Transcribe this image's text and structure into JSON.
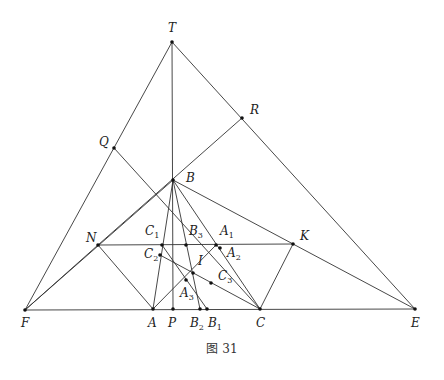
{
  "caption": "图 31",
  "points": [
    {
      "id": "T",
      "label": "T",
      "sub": "",
      "x": 172,
      "y": 42,
      "lx": 168,
      "ly": 32
    },
    {
      "id": "R",
      "label": "R",
      "sub": "",
      "x": 242,
      "y": 118,
      "lx": 250,
      "ly": 114
    },
    {
      "id": "Q",
      "label": "Q",
      "sub": "",
      "x": 114,
      "y": 148,
      "lx": 99,
      "ly": 146
    },
    {
      "id": "B",
      "label": "B",
      "sub": "",
      "x": 173,
      "y": 180,
      "lx": 186,
      "ly": 182
    },
    {
      "id": "N",
      "label": "N",
      "sub": "",
      "x": 98,
      "y": 245,
      "lx": 86,
      "ly": 242
    },
    {
      "id": "K",
      "label": "K",
      "sub": "",
      "x": 293,
      "y": 244,
      "lx": 300,
      "ly": 240
    },
    {
      "id": "C1",
      "label": "C",
      "sub": "1",
      "x": 162,
      "y": 245,
      "lx": 145,
      "ly": 235
    },
    {
      "id": "B3",
      "label": "B",
      "sub": "3",
      "x": 186,
      "y": 245,
      "lx": 189,
      "ly": 235
    },
    {
      "id": "A1",
      "label": "A",
      "sub": "1",
      "x": 216,
      "y": 245,
      "lx": 220,
      "ly": 235
    },
    {
      "id": "A2",
      "label": "A",
      "sub": "2",
      "x": 220,
      "y": 248,
      "lx": 227,
      "ly": 257
    },
    {
      "id": "C2",
      "label": "C",
      "sub": "2",
      "x": 160,
      "y": 255,
      "lx": 144,
      "ly": 258
    },
    {
      "id": "I",
      "label": "I",
      "sub": "",
      "x": 193,
      "y": 273,
      "lx": 198,
      "ly": 265
    },
    {
      "id": "A3",
      "label": "A",
      "sub": "3",
      "x": 186,
      "y": 280,
      "lx": 180,
      "ly": 297
    },
    {
      "id": "C3",
      "label": "C",
      "sub": "3",
      "x": 211,
      "y": 283,
      "lx": 218,
      "ly": 280
    },
    {
      "id": "F",
      "label": "F",
      "sub": "",
      "x": 25,
      "y": 310,
      "lx": 21,
      "ly": 327
    },
    {
      "id": "A",
      "label": "A",
      "sub": "",
      "x": 153,
      "y": 309,
      "lx": 148,
      "ly": 327
    },
    {
      "id": "P",
      "label": "P",
      "sub": "",
      "x": 173,
      "y": 309,
      "lx": 168,
      "ly": 327
    },
    {
      "id": "B2",
      "label": "B",
      "sub": "2",
      "x": 200,
      "y": 309,
      "lx": 190,
      "ly": 327
    },
    {
      "id": "B1",
      "label": "B",
      "sub": "1",
      "x": 207,
      "y": 309,
      "lx": 208,
      "ly": 327
    },
    {
      "id": "C",
      "label": "C",
      "sub": "",
      "x": 260,
      "y": 309,
      "lx": 256,
      "ly": 327
    },
    {
      "id": "E",
      "label": "E",
      "sub": "",
      "x": 415,
      "y": 309,
      "lx": 411,
      "ly": 327
    }
  ],
  "segments": [
    [
      "T",
      "F"
    ],
    [
      "T",
      "E"
    ],
    [
      "T",
      "P"
    ],
    [
      "F",
      "E"
    ],
    [
      "Q",
      "C"
    ],
    [
      "R",
      "N"
    ],
    [
      "F",
      "N"
    ],
    [
      "F",
      "B"
    ],
    [
      "B",
      "E"
    ],
    [
      "N",
      "A"
    ],
    [
      "N",
      "K"
    ],
    [
      "K",
      "C"
    ],
    [
      "B",
      "A"
    ],
    [
      "B",
      "B2"
    ],
    [
      "B",
      "C"
    ],
    [
      "A",
      "A1"
    ],
    [
      "C",
      "C2"
    ],
    [
      "C1",
      "B1"
    ]
  ]
}
